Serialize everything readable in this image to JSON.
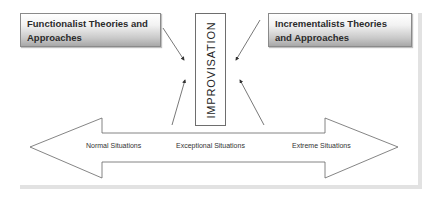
{
  "diagram": {
    "left_box": {
      "line1": "Functionalist Theories and",
      "line2": "Approaches"
    },
    "right_box": {
      "line1": "Incrementalists Theories",
      "line2": "and Approaches"
    },
    "center_box": {
      "label": "IMPROVISATION"
    },
    "situations_arrow": {
      "labels": [
        "Normal Situations",
        "Exceptional Situations",
        "Extreme Situations"
      ],
      "direction": "bidirectional"
    },
    "colors": {
      "box_border": "#8a8a8a",
      "gradient_top": "#ffffff",
      "gradient_bottom": "#a8a8a8",
      "line": "#555555",
      "frame": "#e2e2e2"
    }
  }
}
